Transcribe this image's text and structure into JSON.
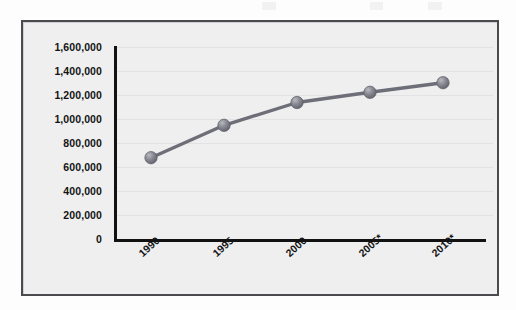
{
  "chart_data": {
    "type": "line",
    "title": "",
    "subtitle": "",
    "xlabel": "",
    "ylabel": "",
    "categories": [
      "1990",
      "1995",
      "2000",
      "2005*",
      "2010*"
    ],
    "values": [
      690000,
      960000,
      1150000,
      1235000,
      1315000
    ],
    "series": [
      {
        "name": "",
        "values": [
          690000,
          960000,
          1150000,
          1235000,
          1315000
        ]
      }
    ],
    "ylim": [
      0,
      1600000
    ],
    "y_ticks": [
      0,
      200000,
      400000,
      600000,
      800000,
      1000000,
      1200000,
      1400000,
      1600000
    ],
    "y_tick_labels": [
      "1,600,000",
      "1,400,000",
      "1,200,000",
      "1,000,000",
      "800,000",
      "600,000",
      "400,000",
      "200,000",
      "0"
    ],
    "grid": true,
    "legend": false,
    "legend_position": "none",
    "annotations": [],
    "marker": "circle",
    "colors": {
      "line": "#6e6e78",
      "marker_fill": "#7e7e88",
      "marker_highlight": "#b4b4bc",
      "plot_background": "#efeff0",
      "frame_border": "#4a4a4f",
      "axis": "#121212",
      "gridline": "#e2e2e4",
      "tick_text": "#141414"
    }
  }
}
